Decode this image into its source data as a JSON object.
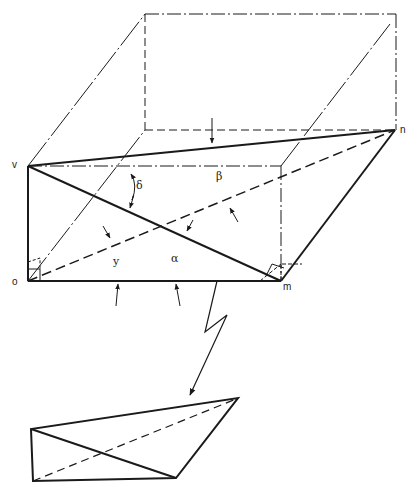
{
  "diagram": {
    "points": {
      "v": {
        "label": "v",
        "x": 28,
        "y": 166
      },
      "o": {
        "label": "o",
        "x": 28,
        "y": 281
      },
      "m": {
        "label": "m",
        "x": 281,
        "y": 281
      },
      "n": {
        "label": "n",
        "x": 395,
        "y": 130
      }
    },
    "angles": {
      "alpha": "α",
      "beta": "β",
      "gamma": "y",
      "delta": "δ"
    },
    "colors": {
      "stroke": "#1a1a1a",
      "background": "#ffffff"
    }
  }
}
